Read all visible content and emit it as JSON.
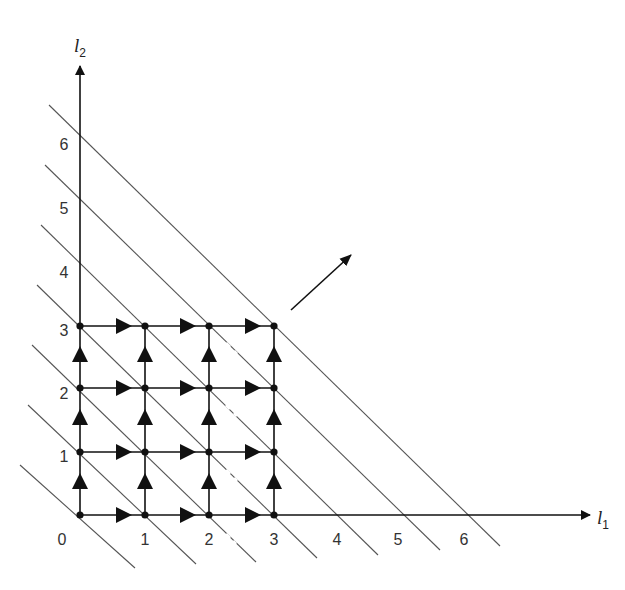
{
  "diagram": {
    "type": "lattice-path diagram",
    "axes": {
      "x": {
        "label": "l",
        "subscript": "1",
        "ticks": [
          "0",
          "1",
          "2",
          "3",
          "4",
          "5",
          "6"
        ]
      },
      "y": {
        "label": "l",
        "subscript": "2",
        "ticks": [
          "1",
          "2",
          "3",
          "4",
          "5",
          "6"
        ]
      }
    },
    "grid": {
      "nodes_x": [
        0,
        1,
        2,
        3
      ],
      "nodes_y": [
        0,
        1,
        2,
        3
      ],
      "edge_direction_horizontal": "right",
      "edge_direction_vertical": "up"
    },
    "diagonal_lines": {
      "description": "lines of constant l1 + l2",
      "sums": [
        0,
        1,
        2,
        3,
        4,
        5,
        6
      ]
    },
    "direction_arrow": {
      "description": "arrow pointing up-right (increasing l1 + l2)"
    },
    "colors": {
      "line": "#1a1a1a",
      "diagonal": "#555555",
      "text": "#333333",
      "background": "#ffffff"
    }
  }
}
